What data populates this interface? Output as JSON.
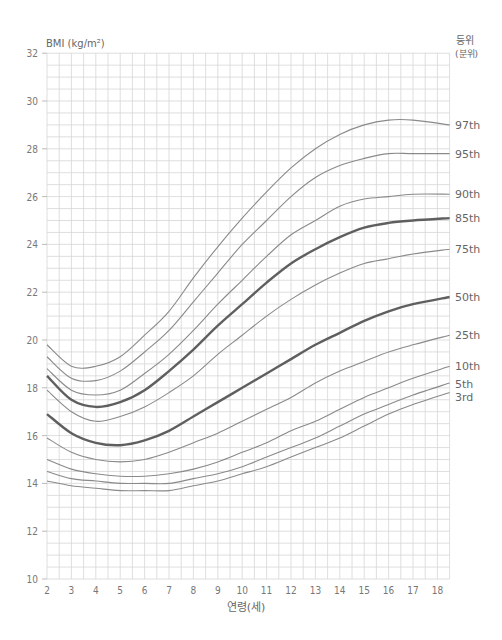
{
  "chart_data": {
    "type": "line",
    "title": "",
    "ylabel": "BMI (kg/m²)",
    "xlabel": "연령(세)",
    "legend_title": [
      "등위",
      "(분위)"
    ],
    "xlim": [
      2,
      18.5
    ],
    "ylim": [
      10,
      32
    ],
    "grid": true,
    "x_ticks": [
      2,
      3,
      4,
      5,
      6,
      7,
      8,
      9,
      10,
      11,
      12,
      13,
      14,
      15,
      16,
      17,
      18
    ],
    "y_ticks": [
      10,
      12,
      14,
      16,
      18,
      20,
      22,
      24,
      26,
      28,
      30,
      32
    ],
    "x": [
      2,
      3,
      4,
      5,
      6,
      7,
      8,
      9,
      10,
      11,
      12,
      13,
      14,
      15,
      16,
      17,
      18.5
    ],
    "series": [
      {
        "name": "97th",
        "bold": false,
        "values": [
          19.8,
          18.9,
          18.9,
          19.3,
          20.2,
          21.2,
          22.6,
          23.9,
          25.1,
          26.2,
          27.2,
          28.0,
          28.6,
          29.0,
          29.2,
          29.2,
          29.0
        ]
      },
      {
        "name": "95th",
        "bold": false,
        "values": [
          19.3,
          18.4,
          18.3,
          18.7,
          19.5,
          20.4,
          21.6,
          22.8,
          24.0,
          25.0,
          26.0,
          26.8,
          27.3,
          27.6,
          27.8,
          27.8,
          27.8
        ]
      },
      {
        "name": "90th",
        "bold": false,
        "values": [
          18.8,
          17.9,
          17.7,
          17.9,
          18.6,
          19.4,
          20.4,
          21.5,
          22.5,
          23.5,
          24.4,
          25.0,
          25.6,
          25.9,
          26.0,
          26.1,
          26.1
        ]
      },
      {
        "name": "85th",
        "bold": true,
        "values": [
          18.5,
          17.5,
          17.2,
          17.4,
          17.9,
          18.7,
          19.6,
          20.6,
          21.5,
          22.4,
          23.2,
          23.8,
          24.3,
          24.7,
          24.9,
          25.0,
          25.1
        ]
      },
      {
        "name": "75th",
        "bold": false,
        "values": [
          17.9,
          17.0,
          16.6,
          16.8,
          17.2,
          17.8,
          18.5,
          19.4,
          20.2,
          21.0,
          21.7,
          22.3,
          22.8,
          23.2,
          23.4,
          23.6,
          23.8
        ]
      },
      {
        "name": "50th",
        "bold": true,
        "values": [
          16.9,
          16.1,
          15.7,
          15.6,
          15.8,
          16.2,
          16.8,
          17.4,
          18.0,
          18.6,
          19.2,
          19.8,
          20.3,
          20.8,
          21.2,
          21.5,
          21.8
        ]
      },
      {
        "name": "25th",
        "bold": false,
        "values": [
          15.9,
          15.3,
          15.0,
          14.9,
          15.0,
          15.3,
          15.7,
          16.1,
          16.6,
          17.1,
          17.6,
          18.2,
          18.7,
          19.1,
          19.5,
          19.8,
          20.2
        ]
      },
      {
        "name": "10th",
        "bold": false,
        "values": [
          15.0,
          14.6,
          14.4,
          14.3,
          14.3,
          14.4,
          14.6,
          14.9,
          15.3,
          15.7,
          16.2,
          16.6,
          17.1,
          17.6,
          18.0,
          18.4,
          18.9
        ]
      },
      {
        "name": "5th",
        "bold": false,
        "values": [
          14.5,
          14.2,
          14.1,
          14.0,
          14.0,
          14.0,
          14.2,
          14.4,
          14.7,
          15.1,
          15.5,
          15.9,
          16.4,
          16.9,
          17.3,
          17.7,
          18.2
        ]
      },
      {
        "name": "3rd",
        "bold": false,
        "values": [
          14.1,
          13.9,
          13.8,
          13.7,
          13.7,
          13.7,
          13.9,
          14.1,
          14.4,
          14.7,
          15.1,
          15.5,
          15.9,
          16.4,
          16.9,
          17.3,
          17.8
        ]
      }
    ],
    "label_positions": {
      "97th": 29.0,
      "95th": 27.8,
      "90th": 26.1,
      "85th": 25.1,
      "75th": 23.8,
      "50th": 21.8,
      "25th": 20.2,
      "10th": 18.9,
      "5th": 18.15,
      "3rd": 17.6
    },
    "colors": {
      "grid": "#d6d6d6",
      "line": "#8a8a8a",
      "bold_line": "#5f5f5f",
      "text": "#666666"
    }
  }
}
